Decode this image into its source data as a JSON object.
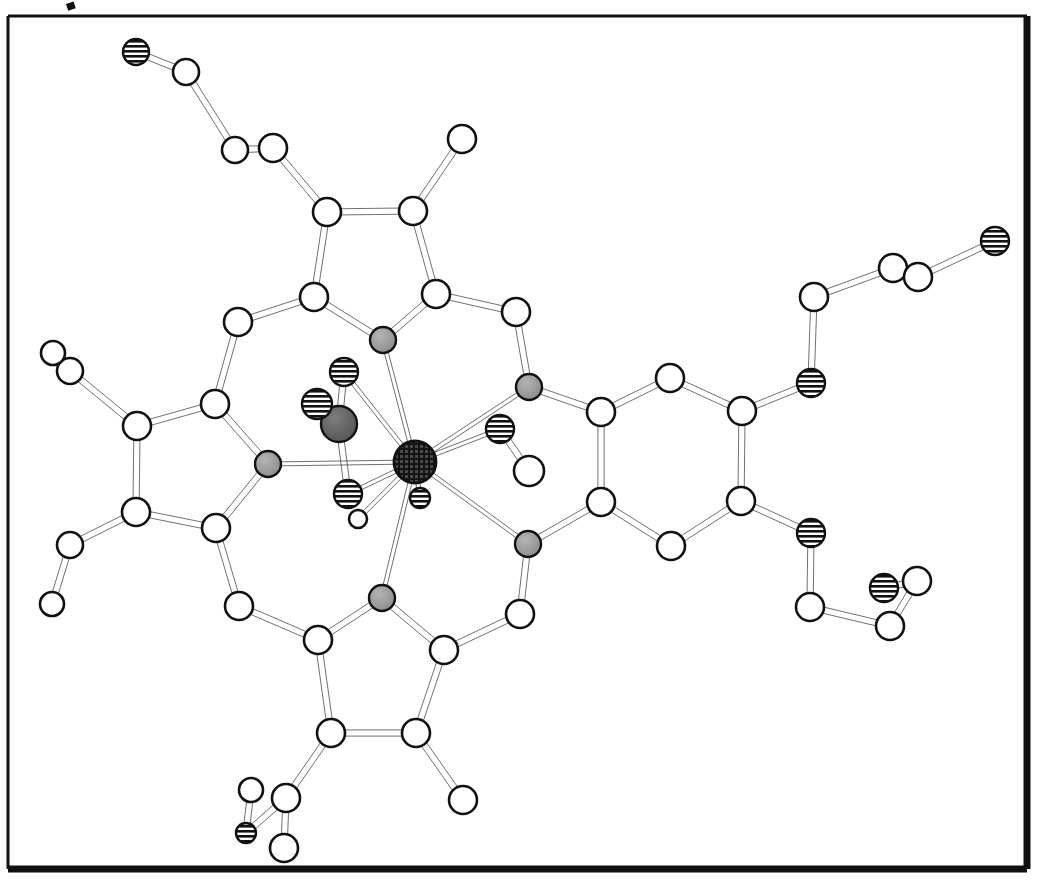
{
  "figure": {
    "kind": "crystal-structure-diagram",
    "title": "",
    "caption": "",
    "background_color": "#ffffff",
    "line_color": "#111111",
    "frame": {
      "x": 8,
      "y": 16,
      "width": 1019,
      "height": 853,
      "thin_stroke": 3,
      "thick_stroke": 7,
      "note": "rectangular border, heavier on bottom and right edges"
    },
    "stray_mark": {
      "x": 66,
      "y": 4,
      "width": 8,
      "height": 7
    }
  },
  "legend": {
    "atom_styles": [
      {
        "key": "carbon",
        "label": "C",
        "fill": "#ffffff",
        "pattern": "open",
        "radius": 13
      },
      {
        "key": "nitrogen",
        "label": "N",
        "fill": "#8c8c8c",
        "pattern": "solid-gray",
        "radius": 13
      },
      {
        "key": "oxygen",
        "label": "O",
        "fill": "#ffffff",
        "pattern": "horizontal-stripes",
        "radius": 13
      },
      {
        "key": "metal",
        "label": "M",
        "fill": "#1a1a1a",
        "pattern": "cross-hatch-grid",
        "radius": 20
      },
      {
        "key": "nitro-n",
        "label": "N",
        "fill": "#5a5a5a",
        "pattern": "dark-gray",
        "radius": 17
      }
    ]
  },
  "chart_data": {
    "type": "diagram",
    "xlabel": "",
    "ylabel": "",
    "atoms": [
      {
        "id": "M1",
        "element": "metal",
        "x": 415,
        "y": 462,
        "r": 21
      },
      {
        "id": "N1",
        "element": "nitrogen",
        "x": 383,
        "y": 340,
        "r": 13
      },
      {
        "id": "N2",
        "element": "nitrogen",
        "x": 529,
        "y": 387,
        "r": 13
      },
      {
        "id": "N3",
        "element": "nitrogen",
        "x": 528,
        "y": 544,
        "r": 13
      },
      {
        "id": "N4",
        "element": "nitrogen",
        "x": 382,
        "y": 598,
        "r": 13
      },
      {
        "id": "N5",
        "element": "nitrogen",
        "x": 268,
        "y": 464,
        "r": 13
      },
      {
        "id": "NO",
        "element": "nitro-n",
        "x": 339,
        "y": 424,
        "r": 18
      },
      {
        "id": "O1",
        "element": "oxygen",
        "x": 344,
        "y": 372,
        "r": 14
      },
      {
        "id": "O2",
        "element": "oxygen",
        "x": 317,
        "y": 404,
        "r": 15
      },
      {
        "id": "O3",
        "element": "oxygen",
        "x": 348,
        "y": 494,
        "r": 14
      },
      {
        "id": "O4",
        "element": "oxygen",
        "x": 420,
        "y": 498,
        "r": 10
      },
      {
        "id": "Ow",
        "element": "carbon",
        "x": 358,
        "y": 519,
        "r": 9
      },
      {
        "id": "O5",
        "element": "oxygen",
        "x": 500,
        "y": 429,
        "r": 14
      },
      {
        "id": "C60",
        "element": "carbon",
        "x": 529,
        "y": 471,
        "r": 15
      },
      {
        "id": "C1",
        "element": "carbon",
        "x": 314,
        "y": 297,
        "r": 14
      },
      {
        "id": "C2",
        "element": "carbon",
        "x": 327,
        "y": 212,
        "r": 14
      },
      {
        "id": "C3",
        "element": "carbon",
        "x": 413,
        "y": 211,
        "r": 14
      },
      {
        "id": "C4",
        "element": "carbon",
        "x": 436,
        "y": 294,
        "r": 14
      },
      {
        "id": "C5",
        "element": "carbon",
        "x": 238,
        "y": 322,
        "r": 14
      },
      {
        "id": "C6",
        "element": "carbon",
        "x": 516,
        "y": 312,
        "r": 14
      },
      {
        "id": "C7",
        "element": "carbon",
        "x": 273,
        "y": 148,
        "r": 14
      },
      {
        "id": "C8",
        "element": "carbon",
        "x": 235,
        "y": 150,
        "r": 13
      },
      {
        "id": "C9",
        "element": "carbon",
        "x": 186,
        "y": 72,
        "r": 13
      },
      {
        "id": "O6",
        "element": "oxygen",
        "x": 136,
        "y": 52,
        "r": 13
      },
      {
        "id": "C10",
        "element": "carbon",
        "x": 462,
        "y": 139,
        "r": 14
      },
      {
        "id": "C11",
        "element": "carbon",
        "x": 215,
        "y": 404,
        "r": 14
      },
      {
        "id": "C12",
        "element": "carbon",
        "x": 137,
        "y": 426,
        "r": 14
      },
      {
        "id": "C13",
        "element": "carbon",
        "x": 136,
        "y": 512,
        "r": 14
      },
      {
        "id": "C14",
        "element": "carbon",
        "x": 216,
        "y": 528,
        "r": 14
      },
      {
        "id": "C15",
        "element": "carbon",
        "x": 239,
        "y": 606,
        "r": 14
      },
      {
        "id": "C16",
        "element": "carbon",
        "x": 70,
        "y": 371,
        "r": 13
      },
      {
        "id": "C17",
        "element": "carbon",
        "x": 53,
        "y": 353,
        "r": 12
      },
      {
        "id": "C18",
        "element": "carbon",
        "x": 70,
        "y": 545,
        "r": 13
      },
      {
        "id": "C19",
        "element": "carbon",
        "x": 52,
        "y": 604,
        "r": 12
      },
      {
        "id": "C20",
        "element": "carbon",
        "x": 318,
        "y": 640,
        "r": 14
      },
      {
        "id": "C21",
        "element": "carbon",
        "x": 444,
        "y": 650,
        "r": 14
      },
      {
        "id": "C22",
        "element": "carbon",
        "x": 416,
        "y": 733,
        "r": 14
      },
      {
        "id": "C23",
        "element": "carbon",
        "x": 331,
        "y": 733,
        "r": 14
      },
      {
        "id": "C24",
        "element": "carbon",
        "x": 520,
        "y": 614,
        "r": 14
      },
      {
        "id": "C25",
        "element": "carbon",
        "x": 463,
        "y": 800,
        "r": 14
      },
      {
        "id": "C26",
        "element": "carbon",
        "x": 286,
        "y": 798,
        "r": 14
      },
      {
        "id": "C27",
        "element": "carbon",
        "x": 284,
        "y": 848,
        "r": 14
      },
      {
        "id": "C28",
        "element": "carbon",
        "x": 251,
        "y": 790,
        "r": 12
      },
      {
        "id": "O7",
        "element": "oxygen",
        "x": 246,
        "y": 833,
        "r": 10
      },
      {
        "id": "C29",
        "element": "carbon",
        "x": 601,
        "y": 412,
        "r": 14
      },
      {
        "id": "C30",
        "element": "carbon",
        "x": 601,
        "y": 502,
        "r": 14
      },
      {
        "id": "C31",
        "element": "carbon",
        "x": 670,
        "y": 378,
        "r": 14
      },
      {
        "id": "C32",
        "element": "carbon",
        "x": 742,
        "y": 411,
        "r": 14
      },
      {
        "id": "C33",
        "element": "carbon",
        "x": 741,
        "y": 501,
        "r": 14
      },
      {
        "id": "C34",
        "element": "carbon",
        "x": 671,
        "y": 546,
        "r": 14
      },
      {
        "id": "O8",
        "element": "oxygen",
        "x": 811,
        "y": 383,
        "r": 14
      },
      {
        "id": "C35",
        "element": "carbon",
        "x": 814,
        "y": 297,
        "r": 14
      },
      {
        "id": "C36",
        "element": "carbon",
        "x": 893,
        "y": 268,
        "r": 14
      },
      {
        "id": "C37",
        "element": "carbon",
        "x": 918,
        "y": 277,
        "r": 14
      },
      {
        "id": "O9",
        "element": "oxygen",
        "x": 995,
        "y": 241,
        "r": 14
      },
      {
        "id": "O10",
        "element": "oxygen",
        "x": 811,
        "y": 533,
        "r": 14
      },
      {
        "id": "C38",
        "element": "carbon",
        "x": 810,
        "y": 607,
        "r": 14
      },
      {
        "id": "C39",
        "element": "carbon",
        "x": 890,
        "y": 626,
        "r": 14
      },
      {
        "id": "C40",
        "element": "carbon",
        "x": 917,
        "y": 581,
        "r": 14
      },
      {
        "id": "O11",
        "element": "oxygen",
        "x": 884,
        "y": 588,
        "r": 14
      }
    ],
    "bonds": [
      {
        "a": "M1",
        "b": "N1",
        "style": "single"
      },
      {
        "a": "M1",
        "b": "N2",
        "style": "single"
      },
      {
        "a": "M1",
        "b": "N3",
        "style": "single"
      },
      {
        "a": "M1",
        "b": "N4",
        "style": "single"
      },
      {
        "a": "M1",
        "b": "N5",
        "style": "single"
      },
      {
        "a": "M1",
        "b": "O1",
        "style": "single"
      },
      {
        "a": "M1",
        "b": "O3",
        "style": "single"
      },
      {
        "a": "M1",
        "b": "O4",
        "style": "single"
      },
      {
        "a": "M1",
        "b": "O5",
        "style": "single"
      },
      {
        "a": "M1",
        "b": "Ow",
        "style": "single"
      },
      {
        "a": "NO",
        "b": "O1",
        "style": "single"
      },
      {
        "a": "NO",
        "b": "O2",
        "style": "single"
      },
      {
        "a": "NO",
        "b": "O3",
        "style": "single"
      },
      {
        "a": "O5",
        "b": "C60",
        "style": "single"
      },
      {
        "a": "N1",
        "b": "C1",
        "style": "single"
      },
      {
        "a": "N1",
        "b": "C4",
        "style": "single"
      },
      {
        "a": "C1",
        "b": "C2",
        "style": "single"
      },
      {
        "a": "C2",
        "b": "C3",
        "style": "single"
      },
      {
        "a": "C3",
        "b": "C4",
        "style": "single"
      },
      {
        "a": "C1",
        "b": "C5",
        "style": "single"
      },
      {
        "a": "C4",
        "b": "C6",
        "style": "single"
      },
      {
        "a": "C2",
        "b": "C7",
        "style": "single"
      },
      {
        "a": "C7",
        "b": "C8",
        "style": "single"
      },
      {
        "a": "C8",
        "b": "C9",
        "style": "single"
      },
      {
        "a": "C9",
        "b": "O6",
        "style": "single"
      },
      {
        "a": "C3",
        "b": "C10",
        "style": "single"
      },
      {
        "a": "C5",
        "b": "C11",
        "style": "single"
      },
      {
        "a": "N5",
        "b": "C11",
        "style": "single"
      },
      {
        "a": "N5",
        "b": "C14",
        "style": "single"
      },
      {
        "a": "C11",
        "b": "C12",
        "style": "single"
      },
      {
        "a": "C12",
        "b": "C13",
        "style": "single"
      },
      {
        "a": "C13",
        "b": "C14",
        "style": "single"
      },
      {
        "a": "C14",
        "b": "C15",
        "style": "single"
      },
      {
        "a": "C12",
        "b": "C16",
        "style": "single"
      },
      {
        "a": "C16",
        "b": "C17",
        "style": "single"
      },
      {
        "a": "C13",
        "b": "C18",
        "style": "single"
      },
      {
        "a": "C18",
        "b": "C19",
        "style": "single"
      },
      {
        "a": "C15",
        "b": "C20",
        "style": "single"
      },
      {
        "a": "N4",
        "b": "C20",
        "style": "single"
      },
      {
        "a": "N4",
        "b": "C21",
        "style": "single"
      },
      {
        "a": "C20",
        "b": "C23",
        "style": "single"
      },
      {
        "a": "C23",
        "b": "C22",
        "style": "single"
      },
      {
        "a": "C22",
        "b": "C21",
        "style": "single"
      },
      {
        "a": "C21",
        "b": "C24",
        "style": "single"
      },
      {
        "a": "C22",
        "b": "C25",
        "style": "single"
      },
      {
        "a": "C23",
        "b": "C26",
        "style": "single"
      },
      {
        "a": "C26",
        "b": "C27",
        "style": "single"
      },
      {
        "a": "C26",
        "b": "O7",
        "style": "single"
      },
      {
        "a": "C28",
        "b": "O7",
        "style": "single"
      },
      {
        "a": "N3",
        "b": "C24",
        "style": "single"
      },
      {
        "a": "N3",
        "b": "C30",
        "style": "single"
      },
      {
        "a": "N2",
        "b": "C6",
        "style": "single"
      },
      {
        "a": "N2",
        "b": "C29",
        "style": "single"
      },
      {
        "a": "C29",
        "b": "C30",
        "style": "single"
      },
      {
        "a": "C29",
        "b": "C31",
        "style": "single"
      },
      {
        "a": "C31",
        "b": "C32",
        "style": "single"
      },
      {
        "a": "C32",
        "b": "C33",
        "style": "single"
      },
      {
        "a": "C33",
        "b": "C34",
        "style": "single"
      },
      {
        "a": "C34",
        "b": "C30",
        "style": "single"
      },
      {
        "a": "C32",
        "b": "O8",
        "style": "single"
      },
      {
        "a": "O8",
        "b": "C35",
        "style": "single"
      },
      {
        "a": "C35",
        "b": "C36",
        "style": "single"
      },
      {
        "a": "C36",
        "b": "C37",
        "style": "single"
      },
      {
        "a": "C37",
        "b": "O9",
        "style": "single"
      },
      {
        "a": "C33",
        "b": "O10",
        "style": "single"
      },
      {
        "a": "O10",
        "b": "C38",
        "style": "single"
      },
      {
        "a": "C38",
        "b": "C39",
        "style": "single"
      },
      {
        "a": "C39",
        "b": "C40",
        "style": "single"
      },
      {
        "a": "C40",
        "b": "O11",
        "style": "single"
      }
    ]
  }
}
